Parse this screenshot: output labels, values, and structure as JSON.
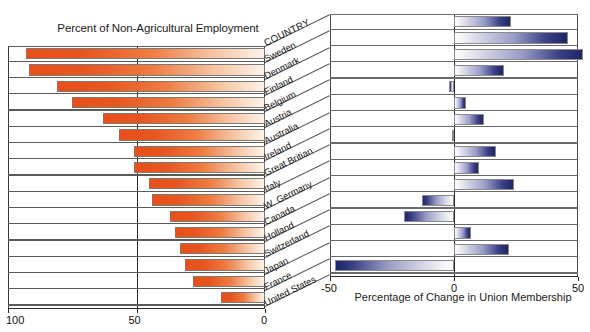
{
  "chart_data": {
    "type": "bar",
    "categories_header": "COUNTRY",
    "categories": [
      "Sweden",
      "Denmark",
      "Finland",
      "Belgium",
      "Austria",
      "Australia",
      "Ireland",
      "Great Britian",
      "Italy",
      "W. Germany",
      "Canada",
      "Holland",
      "Switzerland",
      "Japan",
      "France",
      "United States"
    ],
    "series": [
      {
        "name": "Percent of Non-Agricultural Employment",
        "axis": "left",
        "color": "#e8501b",
        "xlabel": "Percent of Non-Agricultural Employment",
        "xlim": [
          100,
          0
        ],
        "ticks": [
          "100",
          "50",
          "0"
        ],
        "values": [
          93,
          92,
          81,
          75,
          63,
          57,
          51,
          51,
          45,
          44,
          37,
          35,
          33,
          31,
          28,
          17
        ]
      },
      {
        "name": "Percentage of Change in Union Membership",
        "axis": "right",
        "color": "#2a2f7a",
        "xlabel": "Percentage of Change in Union Membership",
        "xlim": [
          -50,
          50
        ],
        "ticks": [
          "-50",
          "0",
          "50"
        ],
        "values": [
          23,
          46,
          52,
          20,
          -2,
          5,
          12,
          -1,
          17,
          10,
          24,
          -13,
          -20,
          7,
          22,
          -48
        ]
      }
    ],
    "grid": false,
    "legend": "none"
  },
  "left_panel": {
    "title": "Percent of Non-Agricultural Employment",
    "axis_ticks": [
      "100",
      "50",
      "0"
    ]
  },
  "right_panel": {
    "title": "Percentage of Change in Union Membership",
    "axis_ticks": [
      "-50",
      "0",
      "50"
    ]
  },
  "country_header": "COUNTRY",
  "countries": [
    "Sweden",
    "Denmark",
    "Finland",
    "Belgium",
    "Austria",
    "Australia",
    "Ireland",
    "Great Britian",
    "Italy",
    "W. Germany",
    "Canada",
    "Holland",
    "Switzerland",
    "Japan",
    "France",
    "United States"
  ]
}
